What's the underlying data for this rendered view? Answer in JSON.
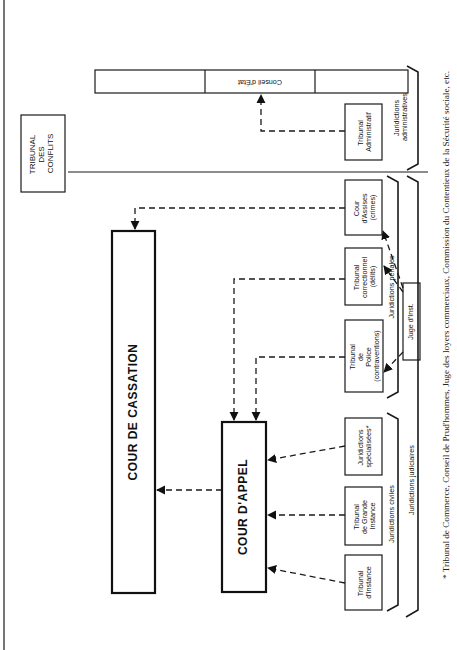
{
  "diagram": {
    "title_nodes": {
      "tribunal_conflits": [
        "TRIBUNAL",
        "DES",
        "CONFLITS"
      ],
      "cour_cassation": "COUR DE CASSATION",
      "cour_appel": "COUR D'APPEL",
      "conseil_etat": "Conseil d'État"
    },
    "lower_courts": {
      "tribunal_administratif": [
        "Tribunal",
        "Administratif"
      ],
      "cour_assises": [
        "Cour",
        "d'Assises",
        "(crimes)"
      ],
      "tribunal_correctionnel": [
        "Tribunal",
        "correctionnel",
        "(délits)"
      ],
      "tribunal_police": [
        "Tribunal",
        "de",
        "Police",
        "(contraventions)"
      ],
      "juridictions_specialisees": [
        "Juridictions",
        "spécialisées*"
      ],
      "tribunal_grande_instance": [
        "Tribunal",
        "de Grande",
        "Instance"
      ],
      "tribunal_instance": [
        "Tribunal",
        "d'Instance"
      ],
      "juge_instruction": "Juge d'Inst."
    },
    "groups": {
      "administratives": [
        "Juridictions",
        "administratives"
      ],
      "penales": "Juridictions pénales",
      "civiles": "Juridictions civiles",
      "judiciaires": "Juridictions judiciaires"
    },
    "edges": [
      {
        "from": "Tribunal Administratif",
        "to": "Conseil d'État",
        "style": "dashed"
      },
      {
        "from": "Cour d'Assises",
        "to": "Cour de Cassation",
        "style": "dashed"
      },
      {
        "from": "Tribunal correctionnel",
        "to": "Cour d'Appel",
        "style": "dashed"
      },
      {
        "from": "Tribunal de Police",
        "to": "Cour d'Appel",
        "style": "dashed"
      },
      {
        "from": "Juridictions spécialisées",
        "to": "Cour d'Appel",
        "style": "dashed"
      },
      {
        "from": "Tribunal de Grande Instance",
        "to": "Cour d'Appel",
        "style": "dashed"
      },
      {
        "from": "Tribunal d'Instance",
        "to": "Cour d'Appel",
        "style": "dashed"
      },
      {
        "from": "Cour d'Appel",
        "to": "Cour de Cassation",
        "style": "dashed"
      },
      {
        "from": "Juge d'Inst.",
        "to": "Cour d'Assises",
        "style": "dashed"
      },
      {
        "from": "Juge d'Inst.",
        "to": "Tribunal correctionnel",
        "style": "dashed"
      },
      {
        "from": "Juge d'Inst.",
        "to": "Tribunal de Police",
        "style": "dashed"
      }
    ],
    "footnote": "* Tribunal de Commerce, Conseil de Prud'hommes, Juge des loyers commerciaux, Commission du Contentieux de la Sécurité sociale, etc."
  }
}
